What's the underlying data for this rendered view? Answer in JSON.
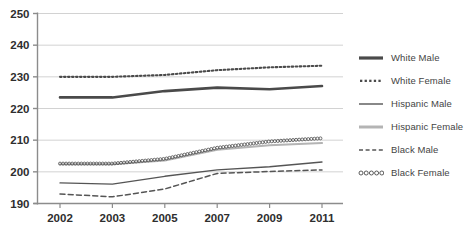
{
  "chart_data": {
    "type": "line",
    "title": "",
    "subtitle": "",
    "xlabel": "",
    "ylabel": "",
    "grid": true,
    "legend_position": "right",
    "categories": [
      "2002",
      "2003",
      "2005",
      "2007",
      "2009",
      "2011"
    ],
    "x_tick_labels": [
      "2002",
      "2003",
      "2005",
      "2007",
      "2009",
      "2011"
    ],
    "y_tick_labels": [
      "250",
      "240",
      "230",
      "220",
      "210",
      "200",
      "190"
    ],
    "ylim": [
      190,
      250
    ],
    "ytick_values": [
      250,
      240,
      230,
      220,
      210,
      200,
      190
    ],
    "series": [
      {
        "name": "White Male",
        "style": "solid-thick",
        "color": "#4a4a4a",
        "values": [
          223.5,
          223.5,
          225.5,
          226.6,
          226.1,
          227.1
        ]
      },
      {
        "name": "White Female",
        "style": "dotted",
        "color": "#4a4a4a",
        "values": [
          230.0,
          230.0,
          230.6,
          232.1,
          233.0,
          233.5
        ]
      },
      {
        "name": "Hispanic Male",
        "style": "solid-thin",
        "color": "#555555",
        "values": [
          196.5,
          196.1,
          198.6,
          200.6,
          201.6,
          203.1
        ]
      },
      {
        "name": "Hispanic Female",
        "style": "solid-light",
        "color": "#b4b4b4",
        "values": [
          202.4,
          202.4,
          203.6,
          207.0,
          208.4,
          209.1
        ]
      },
      {
        "name": "Black Male",
        "style": "dashed",
        "color": "#555555",
        "values": [
          193.0,
          192.1,
          194.6,
          199.5,
          200.1,
          200.6
        ]
      },
      {
        "name": "Black Female",
        "style": "circles",
        "color": "#4a4a4a",
        "values": [
          202.6,
          202.6,
          204.1,
          207.6,
          209.6,
          210.6
        ]
      }
    ]
  },
  "legend": {
    "items": [
      {
        "label": "White Male",
        "swatch": "solid-thick-swatch"
      },
      {
        "label": "White Female",
        "swatch": "dotted-swatch"
      },
      {
        "label": "Hispanic Male",
        "swatch": "solid-thin-swatch"
      },
      {
        "label": "Hispanic Female",
        "swatch": "solid-light-swatch"
      },
      {
        "label": "Black Male",
        "swatch": "dashed-swatch"
      },
      {
        "label": "Black Female",
        "swatch": "circles-swatch"
      }
    ]
  },
  "colors": {
    "grid": "#d2d2d2",
    "axis": "#8c8c8c",
    "text": "#2e2e2e",
    "dark_series": "#4a4a4a",
    "light_series": "#b4b4b4",
    "background": "#ffffff"
  }
}
